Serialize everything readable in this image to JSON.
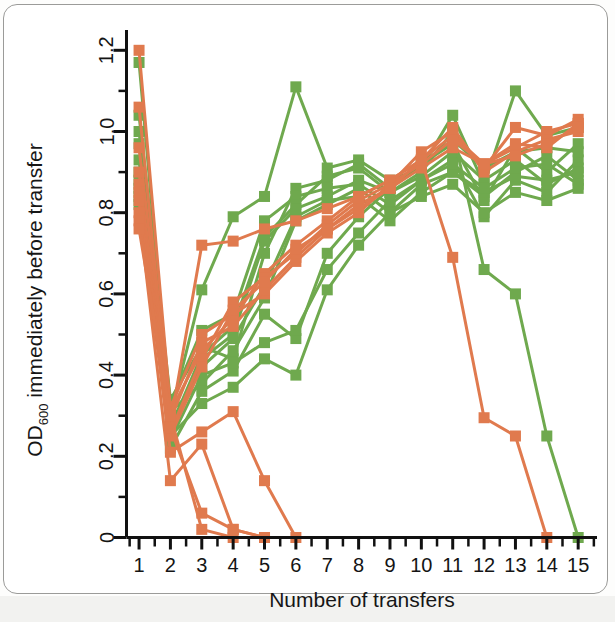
{
  "figure": {
    "background_color": "#ffffff",
    "border_color": "#9b9b99"
  },
  "axes": {
    "y_label_main": "OD",
    "y_label_sub": "600",
    "y_label_rest": " immediately before transfer",
    "y_label_full": "OD600 immediately before transfer",
    "x_label": "Number of transfers",
    "y_ticks": [
      "0",
      "0.2",
      "0.4",
      "0.6",
      "0.8",
      "1.0",
      "1.2"
    ],
    "y_tick_values": [
      0,
      0.2,
      0.4,
      0.6,
      0.8,
      1.0,
      1.2
    ],
    "y_minor_tick_values": [
      0.1,
      0.3,
      0.5,
      0.7,
      0.9,
      1.1
    ],
    "x_ticks": [
      "1",
      "2",
      "3",
      "4",
      "5",
      "6",
      "7",
      "8",
      "9",
      "10",
      "11",
      "12",
      "13",
      "14",
      "15"
    ],
    "x_tick_values": [
      1,
      2,
      3,
      4,
      5,
      6,
      7,
      8,
      9,
      10,
      11,
      12,
      13,
      14,
      15
    ],
    "axis_color": "#111111"
  },
  "chart_data": {
    "type": "line",
    "title": "",
    "subtitle": "",
    "xlabel": "Number of transfers",
    "ylabel": "OD600 immediately before transfer",
    "xlim": [
      0.6,
      15.6
    ],
    "ylim": [
      0,
      1.25
    ],
    "grid": false,
    "legend_position": "none",
    "marker": "square",
    "x": [
      1,
      2,
      3,
      4,
      5,
      6,
      7,
      8,
      9,
      10,
      11,
      12,
      13,
      14,
      15
    ],
    "colors": {
      "green": "#6fa94e",
      "orange": "#e07a4e"
    },
    "series": [
      {
        "name": "green-1",
        "color": "#6fa94e",
        "values": [
          1.17,
          0.3,
          0.61,
          0.79,
          0.84,
          1.11,
          0.91,
          0.93,
          0.88,
          0.91,
          1.04,
          0.87,
          1.1,
          0.99,
          1.01
        ]
      },
      {
        "name": "green-2",
        "color": "#6fa94e",
        "values": [
          1.04,
          0.34,
          0.47,
          0.44,
          0.7,
          0.86,
          0.88,
          0.92,
          0.86,
          0.92,
          0.97,
          0.83,
          0.96,
          0.9,
          0.97
        ]
      },
      {
        "name": "green-3",
        "color": "#6fa94e",
        "values": [
          1.0,
          0.33,
          0.51,
          0.55,
          0.78,
          0.84,
          0.86,
          0.87,
          0.82,
          0.88,
          0.93,
          0.79,
          0.88,
          0.85,
          0.93
        ]
      },
      {
        "name": "green-4",
        "color": "#6fa94e",
        "values": [
          0.97,
          0.28,
          0.42,
          0.49,
          0.62,
          0.79,
          0.83,
          0.84,
          0.78,
          0.85,
          0.9,
          0.84,
          0.9,
          0.94,
          0.88
        ]
      },
      {
        "name": "green-5",
        "color": "#6fa94e",
        "values": [
          0.93,
          0.27,
          0.45,
          0.52,
          0.74,
          0.82,
          0.89,
          0.91,
          0.85,
          0.89,
          0.95,
          0.88,
          0.93,
          0.87,
          0.91
        ]
      },
      {
        "name": "green-6",
        "color": "#6fa94e",
        "values": [
          0.9,
          0.31,
          0.38,
          0.46,
          0.59,
          0.78,
          0.82,
          0.86,
          0.8,
          0.84,
          0.87,
          0.8,
          0.85,
          0.83,
          0.86
        ]
      },
      {
        "name": "green-7",
        "color": "#6fa94e",
        "values": [
          0.88,
          0.22,
          0.36,
          0.41,
          0.55,
          0.49,
          0.7,
          0.79,
          0.86,
          0.92,
          0.98,
          0.91,
          0.95,
          0.96,
          0.95
        ]
      },
      {
        "name": "green-8",
        "color": "#6fa94e",
        "values": [
          0.86,
          0.25,
          0.33,
          0.37,
          0.44,
          0.4,
          0.61,
          0.72,
          0.8,
          0.87,
          0.9,
          0.85,
          0.89,
          0.88,
          0.9
        ]
      },
      {
        "name": "green-9",
        "color": "#6fa94e",
        "values": [
          0.84,
          0.24,
          0.4,
          0.43,
          0.48,
          0.51,
          0.66,
          0.75,
          0.83,
          0.88,
          0.92,
          0.86,
          0.91,
          0.92,
          0.87
        ]
      },
      {
        "name": "green-10-extinct",
        "color": "#6fa94e",
        "values": [
          0.82,
          0.26,
          0.44,
          0.5,
          0.73,
          0.81,
          0.84,
          0.88,
          0.85,
          0.9,
          1.0,
          0.66,
          0.6,
          0.25,
          0.0
        ]
      },
      {
        "name": "orange-1",
        "color": "#e07a4e",
        "values": [
          1.2,
          0.32,
          0.5,
          0.55,
          0.6,
          0.68,
          0.75,
          0.8,
          0.87,
          0.95,
          1.0,
          0.91,
          1.01,
          0.99,
          1.03
        ]
      },
      {
        "name": "orange-2",
        "color": "#e07a4e",
        "values": [
          1.06,
          0.29,
          0.48,
          0.52,
          0.61,
          0.69,
          0.76,
          0.82,
          0.86,
          0.91,
          0.96,
          0.92,
          0.96,
          1.0,
          1.02
        ]
      },
      {
        "name": "orange-3",
        "color": "#e07a4e",
        "values": [
          0.96,
          0.31,
          0.46,
          0.54,
          0.65,
          0.72,
          0.78,
          0.84,
          0.88,
          0.93,
          1.01,
          0.9,
          0.95,
          0.98,
          1.0
        ]
      },
      {
        "name": "orange-4",
        "color": "#e07a4e",
        "values": [
          0.9,
          0.28,
          0.72,
          0.73,
          0.76,
          0.78,
          0.81,
          0.84,
          0.88,
          0.93,
          0.99,
          0.92,
          0.97,
          0.96,
          1.02
        ]
      },
      {
        "name": "orange-5",
        "color": "#e07a4e",
        "values": [
          0.87,
          0.26,
          0.44,
          0.58,
          0.64,
          0.7,
          0.77,
          0.83,
          0.87,
          0.92,
          0.98,
          0.92,
          0.94,
          0.97,
          1.01
        ]
      },
      {
        "name": "orange-6-extinct",
        "color": "#e07a4e",
        "values": [
          0.85,
          0.25,
          0.42,
          0.56,
          0.63,
          0.71,
          0.76,
          0.81,
          0.86,
          0.93,
          0.69,
          0.295,
          0.25,
          0.0,
          null
        ]
      },
      {
        "name": "orange-7-extinct",
        "color": "#e07a4e",
        "values": [
          0.83,
          0.21,
          0.26,
          0.31,
          0.14,
          0.0,
          null,
          null,
          null,
          null,
          null,
          null,
          null,
          null,
          null
        ]
      },
      {
        "name": "orange-8-extinct",
        "color": "#e07a4e",
        "values": [
          0.8,
          0.14,
          0.23,
          0.02,
          0.0,
          null,
          null,
          null,
          null,
          null,
          null,
          null,
          null,
          null,
          null
        ]
      },
      {
        "name": "orange-9-extinct",
        "color": "#e07a4e",
        "values": [
          0.78,
          0.27,
          0.06,
          0.02,
          0.0,
          null,
          null,
          null,
          null,
          null,
          null,
          null,
          null,
          null,
          null
        ]
      },
      {
        "name": "orange-10-extinct",
        "color": "#e07a4e",
        "values": [
          0.76,
          0.3,
          0.02,
          0.0,
          null,
          null,
          null,
          null,
          null,
          null,
          null,
          null,
          null,
          null,
          null
        ]
      }
    ]
  }
}
